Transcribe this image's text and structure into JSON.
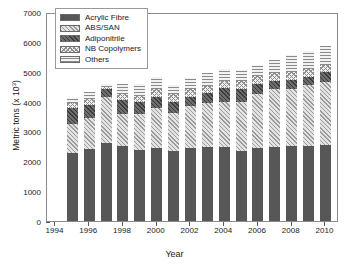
{
  "chart_data": {
    "type": "bar",
    "subtype": "stacked-bar",
    "title": "",
    "xlabel": "Year",
    "ylabel": "Metric tons (x 10³)",
    "ylabel_base": "Metric tons (x 10",
    "ylabel_exp": "3",
    "ylabel_tail": ")",
    "grid": false,
    "legend_position": "top-left",
    "ylim": [
      0,
      7000
    ],
    "ytick_values": [
      0,
      1000,
      2000,
      3000,
      4000,
      5000,
      6000,
      7000
    ],
    "ytick_labels": [
      "0",
      "1000",
      "2000",
      "3000",
      "4000",
      "5000",
      "6000",
      "7000"
    ],
    "xtick_labels": [
      "1994",
      "1996",
      "1998",
      "2000",
      "2002",
      "2004",
      "2006",
      "2008",
      "2010"
    ],
    "xlim": [
      1993.5,
      2010.8
    ],
    "categories": [
      1995,
      1996,
      1997,
      1998,
      1999,
      2000,
      2001,
      2002,
      2003,
      2004,
      2005,
      2006,
      2007,
      2008,
      2009,
      2010
    ],
    "series": [
      {
        "name": "Acrylic Fibre",
        "pattern": "solid-dark-grey",
        "color": "#575757",
        "values": [
          2290,
          2410,
          2610,
          2500,
          2390,
          2450,
          2340,
          2460,
          2470,
          2490,
          2360,
          2440,
          2470,
          2500,
          2510,
          2550
        ]
      },
      {
        "name": "ABS/SAN",
        "pattern": "light-diagonal-hatch",
        "color": "#e3e3e3",
        "values": [
          960,
          1040,
          1530,
          1100,
          1210,
          1350,
          1270,
          1380,
          1490,
          1510,
          1640,
          1830,
          1950,
          1920,
          2030,
          2100
        ]
      },
      {
        "name": "Adiponitrile",
        "pattern": "dark-diagonal-hatch",
        "color": "#6d6d6d",
        "values": [
          540,
          450,
          280,
          440,
          370,
          370,
          380,
          330,
          320,
          440,
          430,
          320,
          280,
          300,
          300,
          330
        ]
      },
      {
        "name": "NB Copolymers",
        "pattern": "cross-hatch-checker",
        "color": "#efefef",
        "values": [
          150,
          180,
          80,
          210,
          220,
          260,
          280,
          260,
          240,
          250,
          250,
          260,
          260,
          280,
          250,
          260
        ]
      },
      {
        "name": "Others",
        "pattern": "horizontal-lines",
        "color": "#f2f2f2",
        "values": [
          180,
          250,
          100,
          330,
          390,
          400,
          280,
          370,
          430,
          390,
          380,
          370,
          440,
          550,
          600,
          630
        ]
      }
    ],
    "totals": [
      4120,
      4330,
      4600,
      4580,
      4580,
      4830,
      4550,
      4800,
      4950,
      5080,
      5060,
      5220,
      5400,
      5550,
      5690,
      5870
    ]
  },
  "legend": {
    "items": [
      {
        "label": "Acrylic Fibre"
      },
      {
        "label": "ABS/SAN"
      },
      {
        "label": "Adiponitrile"
      },
      {
        "label": "NB Copolymers"
      },
      {
        "label": "Others"
      }
    ]
  }
}
